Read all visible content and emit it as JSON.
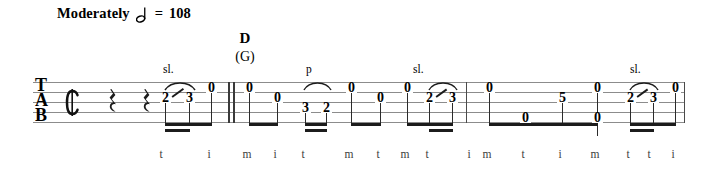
{
  "document": {
    "type": "banjo-tablature",
    "staff_label": [
      "T",
      "A",
      "B"
    ],
    "time_signature": "cut-common",
    "time_signature_glyph": "₵"
  },
  "tempo": {
    "word": "Moderately",
    "note_value": "half-note",
    "equals": "=",
    "bpm": "108"
  },
  "chords": [
    {
      "primary": "D",
      "alternate": "(G)",
      "x": 242
    }
  ],
  "techniques": [
    {
      "label": "sl.",
      "x": 163,
      "y": 64
    },
    {
      "label": "p",
      "x": 305,
      "y": 64
    },
    {
      "label": "sl.",
      "x": 413,
      "y": 64
    },
    {
      "label": "sl.",
      "x": 630,
      "y": 64
    }
  ],
  "barlines": [
    {
      "kind": "double",
      "x": 228
    },
    {
      "kind": "single",
      "x": 466
    },
    {
      "kind": "single",
      "x": 685
    }
  ],
  "rests": [
    {
      "value": "quarter",
      "x": 112
    },
    {
      "value": "quarter",
      "x": 146
    }
  ],
  "notes": [
    {
      "fret": "2",
      "string": 2,
      "x": 163,
      "finger": "t",
      "technique": "slide-start"
    },
    {
      "fret": "3",
      "string": 2,
      "x": 186,
      "finger": "",
      "technique": "slide-end"
    },
    {
      "fret": "0",
      "string": 1,
      "x": 211,
      "finger": "i",
      "technique": ""
    },
    {
      "fret": "0",
      "string": 1,
      "x": 249,
      "finger": "m",
      "technique": ""
    },
    {
      "fret": "0",
      "string": 2,
      "x": 277,
      "finger": "i",
      "technique": ""
    },
    {
      "fret": "3",
      "string": 3,
      "x": 305,
      "finger": "t",
      "technique": "pulloff-start"
    },
    {
      "fret": "2",
      "string": 3,
      "x": 325,
      "finger": "",
      "technique": "pulloff-end"
    },
    {
      "fret": "0",
      "string": 1,
      "x": 351,
      "finger": "m",
      "technique": ""
    },
    {
      "fret": "0",
      "string": 2,
      "x": 380,
      "finger": "t",
      "technique": ""
    },
    {
      "fret": "0",
      "string": 1,
      "x": 407,
      "finger": "m",
      "technique": ""
    },
    {
      "fret": "2",
      "string": 2,
      "x": 429,
      "finger": "t",
      "technique": "slide-start"
    },
    {
      "fret": "3",
      "string": 2,
      "x": 450,
      "finger": "",
      "technique": "slide-end"
    },
    {
      "fret": "0",
      "string": 1,
      "x": 489,
      "finger": "i",
      "technique": ""
    },
    {
      "fret": "0",
      "string": 4,
      "x": 525,
      "finger": "t",
      "technique": ""
    },
    {
      "fret": "5",
      "string": 2,
      "x": 562,
      "finger": "i",
      "technique": ""
    },
    {
      "fret": "0",
      "string": 1,
      "x": 597,
      "finger": "m",
      "technique": ""
    },
    {
      "fret": "0",
      "string": 4,
      "x": 597,
      "finger": "t",
      "technique": ""
    },
    {
      "fret": "2",
      "string": 2,
      "x": 630,
      "finger": "t",
      "technique": "slide-start"
    },
    {
      "fret": "3",
      "string": 2,
      "x": 652,
      "finger": "",
      "technique": "slide-end"
    },
    {
      "fret": "0",
      "string": 1,
      "x": 675,
      "finger": "i",
      "technique": ""
    }
  ],
  "fingerings": [
    {
      "letter": "t",
      "x": 160
    },
    {
      "letter": "i",
      "x": 208
    },
    {
      "letter": "m",
      "x": 246
    },
    {
      "letter": "i",
      "x": 274
    },
    {
      "letter": "t",
      "x": 302
    },
    {
      "letter": "m",
      "x": 348
    },
    {
      "letter": "t",
      "x": 377
    },
    {
      "letter": "m",
      "x": 404
    },
    {
      "letter": "t",
      "x": 426
    },
    {
      "letter": "i",
      "x": 468
    },
    {
      "letter": "m",
      "x": 486
    },
    {
      "letter": "t",
      "x": 522
    },
    {
      "letter": "i",
      "x": 559
    },
    {
      "letter": "m",
      "x": 594
    },
    {
      "letter": "t",
      "x": 627
    },
    {
      "letter": "t",
      "x": 648
    },
    {
      "letter": "i",
      "x": 672
    }
  ],
  "colors": {
    "ink": "#000000",
    "staff": "#8c8c8c",
    "stem": "#2b2b2b",
    "beam": "#1c1c1c",
    "background": "#ffffff"
  }
}
